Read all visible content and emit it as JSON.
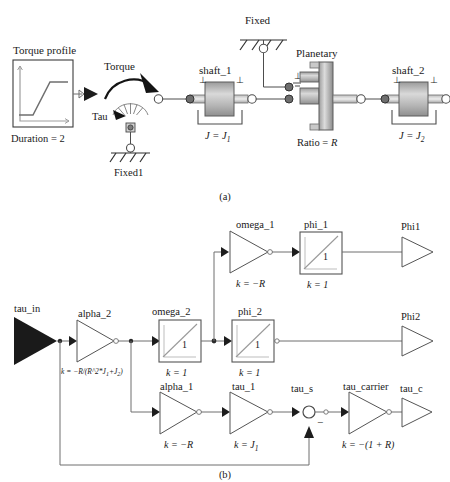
{
  "figure": {
    "caption_a": "(a)",
    "caption_b": "(b)"
  },
  "diagram_a": {
    "title_role": "physical-model",
    "blocks": {
      "torque_profile": {
        "label": "Torque profile",
        "param": "Duration = 2",
        "icon": "ramp-signal-icon"
      },
      "torque": {
        "label": "Torque",
        "port_label": "Tau",
        "icon": "torque-arrow-icon"
      },
      "fixed1": {
        "label": "Fixed1",
        "icon": "ground-icon"
      },
      "fixed": {
        "label": "Fixed",
        "icon": "ground-icon"
      },
      "shaft_1": {
        "label": "shaft_1",
        "param": "J = J",
        "param_sub": "1",
        "icon": "inertia-icon"
      },
      "planetary": {
        "label": "Planetary",
        "param": "Ratio = R",
        "icon": "planetary-gear-icon"
      },
      "shaft_2": {
        "label": "shaft_2",
        "param": "J = J",
        "param_sub": "2",
        "icon": "inertia-icon"
      }
    },
    "flange_marker": "⊥"
  },
  "diagram_b": {
    "title_role": "signal-block-diagram",
    "blocks": {
      "tau_in": {
        "label": "tau_in",
        "kind": "input-port"
      },
      "alpha_2": {
        "label": "alpha_2",
        "kind": "gain",
        "gain_prefix": "k = −R/(R^2*J",
        "gain_sub1": "1",
        "gain_mid": "+J",
        "gain_sub2": "2",
        "gain_suffix": ")"
      },
      "omega_2": {
        "label": "omega_2",
        "kind": "integrator",
        "gain": "k = 1",
        "glyph": "1"
      },
      "phi_2": {
        "label": "phi_2",
        "kind": "integrator",
        "gain": "k = 1",
        "glyph": "1"
      },
      "omega_1": {
        "label": "omega_1",
        "kind": "gain",
        "gain": "k = −R"
      },
      "phi_1": {
        "label": "phi_1",
        "kind": "integrator",
        "gain": "k = 1",
        "glyph": "1"
      },
      "alpha_1": {
        "label": "alpha_1",
        "kind": "gain",
        "gain": "k = −R"
      },
      "tau_1": {
        "label": "tau_1",
        "kind": "gain",
        "gain_prefix": "k = J",
        "gain_sub": "1"
      },
      "tau_s": {
        "label": "tau_s",
        "kind": "sum-junction",
        "sign": "−"
      },
      "tau_carrier": {
        "label": "tau_carrier",
        "kind": "gain",
        "gain": "k = −(1 + R)"
      },
      "phi1_out": {
        "label": "Phi1",
        "kind": "output-port"
      },
      "phi2_out": {
        "label": "Phi2",
        "kind": "output-port"
      },
      "tau_c_out": {
        "label": "tau_c",
        "kind": "output-port"
      }
    }
  },
  "colors": {
    "line": "#4d4d4d",
    "text": "#1a1a1a",
    "fill_light": "#f2f2f2",
    "gradient_dark": "#8c8c8c",
    "gradient_light": "#e8e8e8",
    "node_dark": "#555555",
    "solid_black": "#111111"
  }
}
